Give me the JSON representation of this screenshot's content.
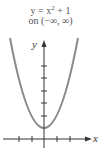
{
  "caption": {
    "equation_prefix": "y = x",
    "exponent": "2",
    "equation_suffix": " + 1",
    "domain": "on (−∞, ∞)"
  },
  "graph": {
    "x_label": "x",
    "y_label": "y",
    "curve_color": "#8a8a8a",
    "axis_color": "#333333",
    "x_ticks": [
      -2,
      -1,
      1,
      2
    ],
    "y_ticks": [
      1,
      2,
      3,
      4,
      5
    ],
    "vertex": [
      0,
      1
    ]
  }
}
